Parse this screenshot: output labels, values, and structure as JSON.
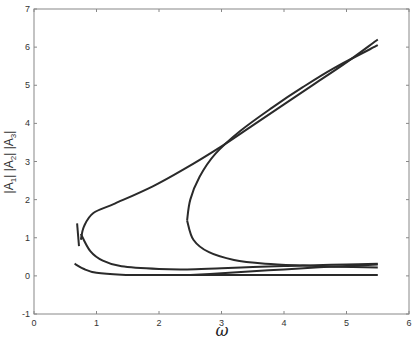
{
  "chart_data": {
    "type": "line",
    "title": "",
    "xlabel": "ω",
    "ylabel": "|A1|  |A2|  |A3|",
    "ylabel_parts": [
      "|A",
      "1",
      "|  |A",
      "2",
      "|  |A",
      "3",
      "|"
    ],
    "xlim": [
      0,
      6
    ],
    "ylim": [
      -1,
      7
    ],
    "xticks": [
      0,
      1,
      2,
      3,
      4,
      5,
      6
    ],
    "yticks": [
      -1,
      0,
      1,
      2,
      3,
      4,
      5,
      6,
      7
    ],
    "grid": false,
    "legend": null,
    "line_color": "#2a2a2a",
    "series": [
      {
        "name": "upper-branch-outer",
        "points": [
          [
            0.75,
            0.95
          ],
          [
            0.8,
            1.3
          ],
          [
            0.95,
            1.65
          ],
          [
            1.3,
            1.9
          ],
          [
            1.9,
            2.35
          ],
          [
            2.4,
            2.8
          ],
          [
            3.0,
            3.4
          ],
          [
            3.5,
            3.95
          ],
          [
            4.0,
            4.5
          ],
          [
            4.5,
            5.05
          ],
          [
            5.0,
            5.6
          ],
          [
            5.5,
            6.2
          ]
        ]
      },
      {
        "name": "upper-branch-inner",
        "points": [
          [
            2.45,
            1.45
          ],
          [
            2.5,
            2.0
          ],
          [
            2.65,
            2.6
          ],
          [
            2.9,
            3.2
          ],
          [
            3.3,
            3.8
          ],
          [
            3.8,
            4.4
          ],
          [
            4.3,
            4.95
          ],
          [
            4.8,
            5.45
          ],
          [
            5.5,
            6.05
          ]
        ]
      },
      {
        "name": "middle-branch",
        "points": [
          [
            0.75,
            1.1
          ],
          [
            0.9,
            0.65
          ],
          [
            1.1,
            0.4
          ],
          [
            1.4,
            0.25
          ],
          [
            2.0,
            0.18
          ],
          [
            2.45,
            0.17
          ],
          [
            3.0,
            0.2
          ],
          [
            3.5,
            0.23
          ],
          [
            4.0,
            0.26
          ],
          [
            4.5,
            0.28
          ],
          [
            5.0,
            0.3
          ],
          [
            5.5,
            0.32
          ]
        ]
      },
      {
        "name": "inner-lower-return",
        "points": [
          [
            2.45,
            1.45
          ],
          [
            2.55,
            0.95
          ],
          [
            2.8,
            0.62
          ],
          [
            3.2,
            0.42
          ],
          [
            3.7,
            0.32
          ],
          [
            4.3,
            0.27
          ],
          [
            4.8,
            0.24
          ],
          [
            5.5,
            0.22
          ]
        ]
      },
      {
        "name": "lower-branch",
        "points": [
          [
            0.65,
            0.32
          ],
          [
            0.8,
            0.18
          ],
          [
            1.0,
            0.08
          ],
          [
            1.4,
            0.03
          ],
          [
            2.0,
            0.02
          ],
          [
            3.0,
            0.02
          ],
          [
            4.0,
            0.02
          ],
          [
            5.5,
            0.02
          ]
        ]
      },
      {
        "name": "lower-thin-branch",
        "points": [
          [
            2.5,
            0.02
          ],
          [
            3.0,
            0.07
          ],
          [
            3.5,
            0.12
          ],
          [
            4.0,
            0.17
          ],
          [
            4.5,
            0.22
          ],
          [
            5.0,
            0.26
          ],
          [
            5.5,
            0.3
          ]
        ]
      },
      {
        "name": "vertical-marker-segment",
        "points": [
          [
            0.69,
            1.38
          ],
          [
            0.72,
            0.78
          ]
        ]
      }
    ]
  }
}
